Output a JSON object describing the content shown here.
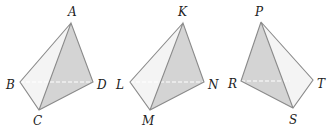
{
  "figure": {
    "shade_color": "#d4d4d4",
    "light_face_color": "#f4f4f4",
    "edge_color": "#8a8a8a",
    "tetrahedra": [
      {
        "name": "ABCD",
        "vertices": {
          "A": {
            "label": "A",
            "x": 71,
            "y": 23,
            "lx": 68,
            "ly": 16
          },
          "B": {
            "label": "B",
            "x": 20,
            "y": 82,
            "lx": 6,
            "ly": 89
          },
          "C": {
            "label": "C",
            "x": 39,
            "y": 110,
            "lx": 33,
            "ly": 125
          },
          "D": {
            "label": "D",
            "x": 93,
            "y": 82,
            "lx": 97,
            "ly": 89
          }
        },
        "shaded_face": [
          "A",
          "C",
          "D"
        ],
        "hidden_edge": [
          "B",
          "D"
        ]
      },
      {
        "name": "KLMN",
        "vertices": {
          "K": {
            "label": "K",
            "x": 183,
            "y": 23,
            "lx": 178,
            "ly": 16
          },
          "L": {
            "label": "L",
            "x": 130,
            "y": 82,
            "lx": 116,
            "ly": 89
          },
          "M": {
            "label": "M",
            "x": 150,
            "y": 110,
            "lx": 142,
            "ly": 125
          },
          "N": {
            "label": "N",
            "x": 204,
            "y": 82,
            "lx": 208,
            "ly": 89
          }
        },
        "shaded_face": [
          "K",
          "M",
          "N"
        ],
        "hidden_edge": [
          "L",
          "N"
        ]
      },
      {
        "name": "PRST",
        "vertices": {
          "P": {
            "label": "P",
            "x": 261,
            "y": 22,
            "lx": 255,
            "ly": 16
          },
          "R": {
            "label": "R",
            "x": 241,
            "y": 81,
            "lx": 228,
            "ly": 88
          },
          "S": {
            "label": "S",
            "x": 293,
            "y": 108,
            "lx": 289,
            "ly": 124
          },
          "T": {
            "label": "T",
            "x": 313,
            "y": 80,
            "lx": 317,
            "ly": 88
          }
        },
        "shaded_face": [
          "P",
          "R",
          "S"
        ],
        "hidden_edge": [
          "R",
          "T"
        ]
      }
    ]
  }
}
